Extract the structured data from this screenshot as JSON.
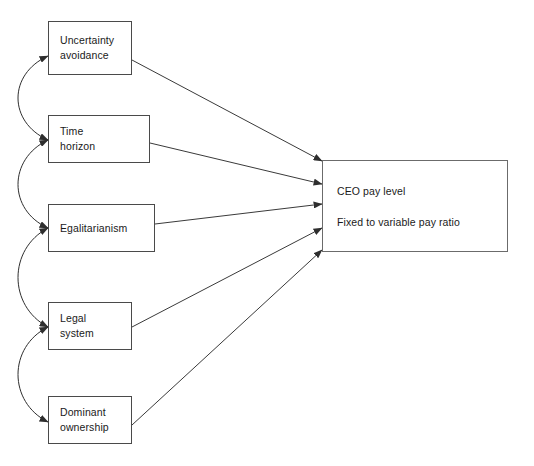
{
  "diagram": {
    "type": "path-diagram",
    "canvas": {
      "width": 534,
      "height": 466,
      "background": "#ffffff"
    },
    "colors": {
      "box_border": "#4a4a4a",
      "outcome_border": "#6b6b6b",
      "arrow_line": "#3a3a3a",
      "arc_line": "#2e2e2e",
      "text": "#1a1a1a",
      "background": "#ffffff"
    },
    "predictors": [
      {
        "id": "uncertainty-avoidance",
        "label": "Uncertainty\navoidance",
        "x": 48,
        "y": 21,
        "width": 84,
        "height": 54
      },
      {
        "id": "time-horizon",
        "label": "Time\nhorizon",
        "x": 48,
        "y": 115,
        "width": 102,
        "height": 48
      },
      {
        "id": "egalitarianism",
        "label": "Egalitarianism",
        "x": 48,
        "y": 204,
        "width": 107,
        "height": 48
      },
      {
        "id": "legal-system",
        "label": "Legal\nsystem",
        "x": 48,
        "y": 302,
        "width": 84,
        "height": 48
      },
      {
        "id": "dominant-ownership",
        "label": "Dominant\nownership",
        "x": 48,
        "y": 396,
        "width": 84,
        "height": 48
      }
    ],
    "outcome": {
      "id": "ceo-pay-outcomes",
      "x": 322,
      "y": 160,
      "width": 186,
      "height": 92,
      "lines": [
        "CEO pay level",
        "Fixed to variable pay ratio"
      ]
    },
    "causal_arrows": [
      {
        "from": "uncertainty-avoidance",
        "to": "ceo-pay-outcomes",
        "head": "single",
        "start": [
          132,
          60
        ],
        "end": [
          322,
          161
        ]
      },
      {
        "from": "time-horizon",
        "to": "ceo-pay-outcomes",
        "head": "single",
        "start": [
          150,
          143
        ],
        "end": [
          322,
          184
        ]
      },
      {
        "from": "egalitarianism",
        "to": "ceo-pay-outcomes",
        "head": "single",
        "start": [
          155,
          224
        ],
        "end": [
          322,
          204
        ]
      },
      {
        "from": "legal-system",
        "to": "ceo-pay-outcomes",
        "head": "single",
        "start": [
          132,
          327
        ],
        "end": [
          322,
          228
        ]
      },
      {
        "from": "dominant-ownership",
        "to": "ceo-pay-outcomes",
        "head": "single",
        "start": [
          132,
          425
        ],
        "end": [
          322,
          250
        ]
      }
    ],
    "correlation_arcs": [
      {
        "from": "uncertainty-avoidance",
        "to": "time-horizon",
        "head": "double",
        "start": [
          48,
          56
        ],
        "end": [
          48,
          140
        ],
        "bulge": -38
      },
      {
        "from": "time-horizon",
        "to": "egalitarianism",
        "head": "double",
        "start": [
          48,
          140
        ],
        "end": [
          48,
          228
        ],
        "bulge": -38
      },
      {
        "from": "egalitarianism",
        "to": "legal-system",
        "head": "double",
        "start": [
          48,
          228
        ],
        "end": [
          48,
          327
        ],
        "bulge": -38
      },
      {
        "from": "legal-system",
        "to": "dominant-ownership",
        "head": "double",
        "start": [
          48,
          327
        ],
        "end": [
          48,
          422
        ],
        "bulge": -38
      }
    ]
  }
}
